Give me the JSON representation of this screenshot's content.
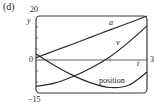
{
  "panel_label": "(d)",
  "chart_data": {
    "type": "line",
    "title": "",
    "xlabel": "t",
    "ylabel": "y",
    "xlim": [
      0,
      3
    ],
    "ylim": [
      -15,
      20
    ],
    "tick_labels": {
      "y_top": "20",
      "y_zero": "0",
      "y_bottom": "−15",
      "x_right": "3"
    },
    "grid": false,
    "legend": "inline labels",
    "series": [
      {
        "name": "a",
        "label": "a",
        "x": [
          0,
          0.5,
          1,
          1.5,
          2,
          2.5,
          3
        ],
        "values": [
          1,
          4.2,
          7.3,
          10.5,
          13.7,
          16.8,
          20
        ]
      },
      {
        "name": "v",
        "label": "v",
        "x": [
          0,
          0.5,
          1,
          1.5,
          2,
          2.5,
          3
        ],
        "values": [
          -12,
          -10.5,
          -7.5,
          -3.5,
          1.5,
          8,
          15.5
        ]
      },
      {
        "name": "position",
        "label": "position",
        "x": [
          0,
          0.5,
          1,
          1.5,
          2,
          2.5,
          3
        ],
        "values": [
          2.7,
          -2.5,
          -7,
          -10.5,
          -12.5,
          -11.5,
          -5.5
        ]
      }
    ]
  },
  "colors": {
    "line": "#2a2a2a",
    "frame": "#3a3a3a",
    "axis": "#555555"
  }
}
